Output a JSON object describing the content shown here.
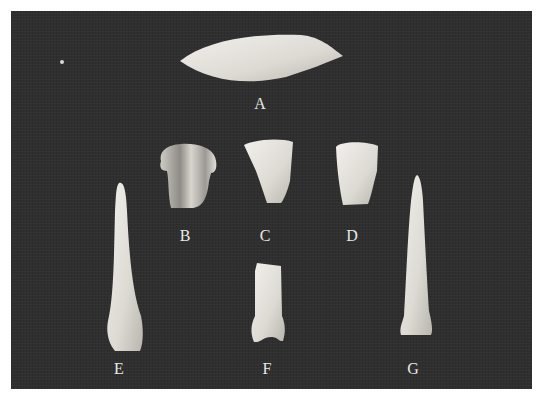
{
  "photo": {
    "description": "Black-and-white photograph of seven stone artifacts on dark textured background",
    "background_color": "#2f2f2f",
    "border_color": "#ffffff"
  },
  "artifacts": [
    {
      "label": "A",
      "shape": "leaf-shaped biface point"
    },
    {
      "label": "B",
      "shape": "notched fragment"
    },
    {
      "label": "C",
      "shape": "trapezoidal fragment"
    },
    {
      "label": "D",
      "shape": "trapezoidal fragment"
    },
    {
      "label": "E",
      "shape": "elongated drill/awl"
    },
    {
      "label": "F",
      "shape": "drill base fragment"
    },
    {
      "label": "G",
      "shape": "elongated drill/awl"
    }
  ]
}
